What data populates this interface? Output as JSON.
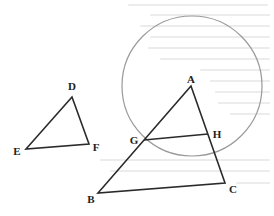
{
  "diagram": {
    "type": "geometry",
    "colors": {
      "line": "#2a2a2a",
      "circle": "#9a9a9a",
      "label": "#222222",
      "background_text": "#ececec"
    },
    "triangle_small": {
      "vertices": {
        "D": {
          "label": "D",
          "x": 72,
          "y": 97
        },
        "E": {
          "label": "E",
          "x": 26,
          "y": 149
        },
        "F": {
          "label": "F",
          "x": 89,
          "y": 144
        }
      }
    },
    "triangle_large": {
      "vertices": {
        "A": {
          "label": "A",
          "x": 191,
          "y": 86
        },
        "B": {
          "label": "B",
          "x": 98,
          "y": 193
        },
        "C": {
          "label": "C",
          "x": 225,
          "y": 183
        }
      }
    },
    "segment_GH": {
      "G": {
        "label": "G",
        "x": 144,
        "y": 140
      },
      "H": {
        "label": "H",
        "x": 208,
        "y": 134
      }
    },
    "circle": {
      "cx": 192,
      "cy": 86,
      "r": 70
    }
  }
}
